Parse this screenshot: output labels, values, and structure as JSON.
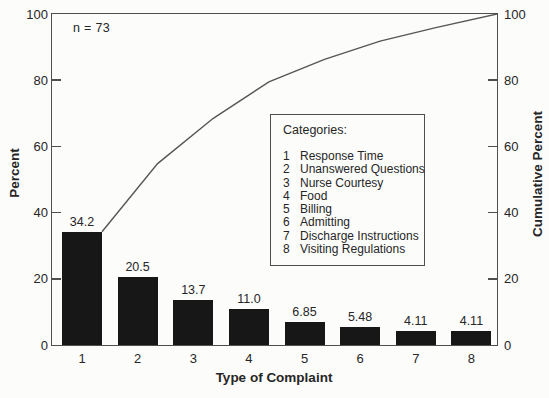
{
  "chart_data": {
    "type": "pareto",
    "annotation": "n = 73",
    "xlabel": "Type of Complaint",
    "ylabel_left": "Percent",
    "ylabel_right": "Cumulative Percent",
    "categories": [
      "1",
      "2",
      "3",
      "4",
      "5",
      "6",
      "7",
      "8"
    ],
    "values": [
      34.2,
      20.5,
      13.7,
      11.0,
      6.85,
      5.48,
      4.11,
      4.11
    ],
    "value_labels": [
      "34.2",
      "20.5",
      "13.7",
      "11.0",
      "6.85",
      "5.48",
      "4.11",
      "4.11"
    ],
    "cumulative": [
      34.2,
      54.8,
      68.5,
      79.5,
      86.3,
      91.8,
      95.9,
      100
    ],
    "y_ticks": [
      0,
      20,
      40,
      60,
      80,
      100
    ],
    "ylim": [
      0,
      100
    ],
    "grid": false,
    "bar_color": "#171717",
    "line_color": "#565656",
    "axis_color": "#4f4f4f",
    "legend_position": "inside-right",
    "legend": {
      "title": "Categories:",
      "items": [
        {
          "num": "1",
          "label": "Response Time"
        },
        {
          "num": "2",
          "label": "Unanswered Questions"
        },
        {
          "num": "3",
          "label": "Nurse Courtesy"
        },
        {
          "num": "4",
          "label": "Food"
        },
        {
          "num": "5",
          "label": "Billing"
        },
        {
          "num": "6",
          "label": "Admitting"
        },
        {
          "num": "7",
          "label": "Discharge Instructions"
        },
        {
          "num": "8",
          "label": "Visiting Regulations"
        }
      ]
    }
  }
}
